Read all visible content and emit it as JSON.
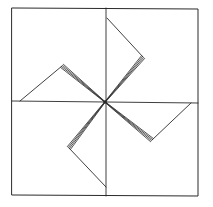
{
  "drawing": {
    "subject": "pinwheel sketch",
    "style": "hand-drawn line art",
    "stroke_color": "#2a2a2a",
    "background_color": "#ffffff",
    "frame": {
      "x1": 12,
      "y1": 8,
      "x2": 198,
      "y2": 196
    },
    "center": {
      "x": 105,
      "y": 102
    },
    "guide_lines": {
      "vertical": {
        "x1": 106,
        "y1": 8,
        "x2": 106,
        "y2": 196
      },
      "horizontal": {
        "x1": 12,
        "y1": 101,
        "x2": 198,
        "y2": 103
      }
    },
    "blades": [
      {
        "name": "top",
        "tip": {
          "x": 107,
          "y": 18
        },
        "corner": {
          "x": 143,
          "y": 57
        }
      },
      {
        "name": "left",
        "tip": {
          "x": 20,
          "y": 101
        },
        "corner": {
          "x": 62,
          "y": 66
        }
      },
      {
        "name": "right",
        "tip": {
          "x": 191,
          "y": 103
        },
        "corner": {
          "x": 152,
          "y": 140
        }
      },
      {
        "name": "bottom",
        "tip": {
          "x": 106,
          "y": 187
        },
        "corner": {
          "x": 69,
          "y": 148
        }
      }
    ]
  }
}
